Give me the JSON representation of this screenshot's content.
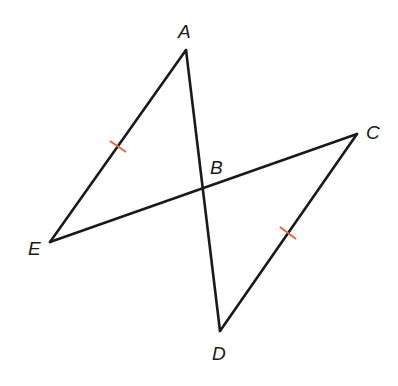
{
  "diagram": {
    "type": "geometry",
    "points": {
      "A": {
        "label": "A",
        "x": 186,
        "y": 50,
        "label_x": 178,
        "label_y": 38
      },
      "B": {
        "label": "B",
        "x": 203,
        "y": 189,
        "label_x": 210,
        "label_y": 174
      },
      "C": {
        "label": "C",
        "x": 357,
        "y": 134,
        "label_x": 366,
        "label_y": 139
      },
      "D": {
        "label": "D",
        "x": 220,
        "y": 331,
        "label_x": 212,
        "label_y": 360
      },
      "E": {
        "label": "E",
        "x": 50,
        "y": 242,
        "label_x": 28,
        "label_y": 255
      }
    },
    "segments": [
      {
        "from": "A",
        "to": "E"
      },
      {
        "from": "A",
        "to": "D"
      },
      {
        "from": "E",
        "to": "C"
      },
      {
        "from": "C",
        "to": "D"
      }
    ],
    "congruence_marks": [
      {
        "segment": "AE",
        "ticks": 1,
        "x": 118,
        "y": 146
      },
      {
        "segment": "CD",
        "ticks": 1,
        "x": 288,
        "y": 233
      }
    ],
    "colors": {
      "line": "#1a1a1a",
      "tick": "#e8643c",
      "background": "#ffffff"
    }
  }
}
